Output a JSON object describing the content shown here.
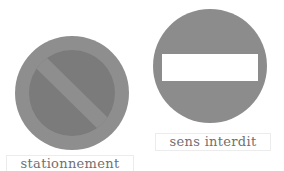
{
  "signs": [
    {
      "id": "no-parking",
      "label": "stationnement",
      "colors": {
        "ring": "#8e8e8e",
        "inner": "#7b7b7b",
        "band": "#8e8e8e"
      }
    },
    {
      "id": "no-entry",
      "label": "sens interdit",
      "colors": {
        "disk": "#8c8c8c",
        "bar": "#ffffff"
      }
    }
  ]
}
